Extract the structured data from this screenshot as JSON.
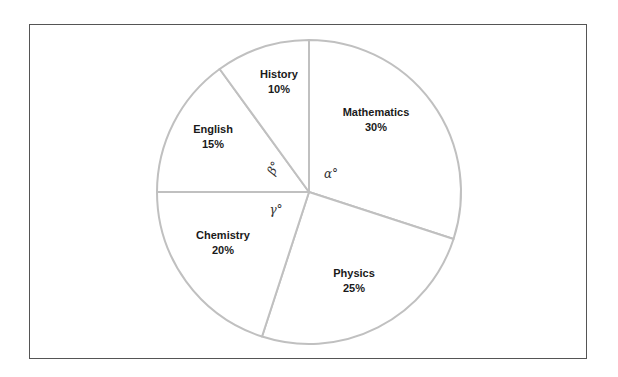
{
  "chart_data": {
    "type": "pie",
    "title": "",
    "start_angle_deg": 0,
    "direction": "clockwise",
    "slices": [
      {
        "label": "Mathematics",
        "value": 30,
        "value_label": "30%"
      },
      {
        "label": "Physics",
        "value": 25,
        "value_label": "25%"
      },
      {
        "label": "Chemistry",
        "value": 20,
        "value_label": "20%"
      },
      {
        "label": "English",
        "value": 15,
        "value_label": "15%"
      },
      {
        "label": "History",
        "value": 10,
        "value_label": "10%"
      }
    ],
    "angle_annotations": [
      {
        "symbol": "α°",
        "slice": "Mathematics"
      },
      {
        "symbol": "β°",
        "slice": "English"
      },
      {
        "symbol": "γ°",
        "slice": "Chemistry"
      }
    ],
    "fill_color": "#ffffff",
    "stroke_color": "#c0c0c0",
    "legend": "none"
  }
}
